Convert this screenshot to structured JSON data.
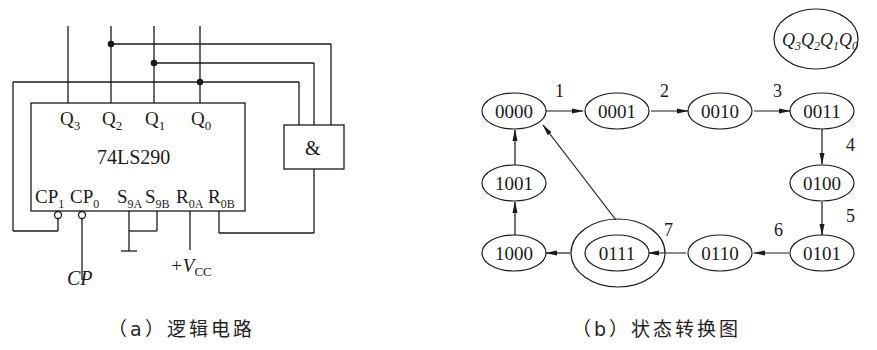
{
  "circuit": {
    "chip_name": "74LS290",
    "outputs": [
      "Q",
      "Q",
      "Q",
      "Q"
    ],
    "output_subs": [
      "3",
      "2",
      "1",
      "0"
    ],
    "inputs": {
      "cp1": "CP",
      "cp1_sub": "1",
      "cp0": "CP",
      "cp0_sub": "0",
      "s9a": "S",
      "s9a_sub": "9A",
      "s9b": "S",
      "s9b_sub": "9B",
      "r0a": "R",
      "r0a_sub": "0A",
      "r0b": "R",
      "r0b_sub": "0B"
    },
    "and_gate": "&",
    "clock_label": "CP",
    "vcc_prefix": "+V",
    "vcc_sub": "CC",
    "caption": "（a）逻辑电路"
  },
  "state_diagram": {
    "legend": {
      "q": "Q",
      "subs": [
        "3",
        "2",
        "1",
        "0"
      ]
    },
    "states": [
      "0000",
      "0001",
      "0010",
      "0011",
      "0100",
      "0101",
      "0110",
      "0111",
      "1000",
      "1001"
    ],
    "transition_labels": [
      "1",
      "2",
      "3",
      "4",
      "5",
      "6",
      "7"
    ],
    "caption": "（b）状态转换图"
  }
}
